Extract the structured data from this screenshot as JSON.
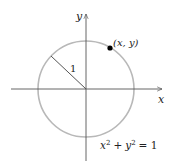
{
  "diagram": {
    "axes": {
      "x_label": "x",
      "y_label": "y"
    },
    "circle": {
      "center": [
        86,
        89
      ],
      "radius": 48,
      "stroke": "#b8b8b8"
    },
    "radius_label": "1",
    "point": {
      "label": "(x, y)",
      "color": "#000000"
    },
    "equation": {
      "x_term": "x",
      "x_exp": "2",
      "plus": "+",
      "y_term": "y",
      "y_exp": "2",
      "rhs": "= 1"
    },
    "axis_color": "#555555"
  }
}
